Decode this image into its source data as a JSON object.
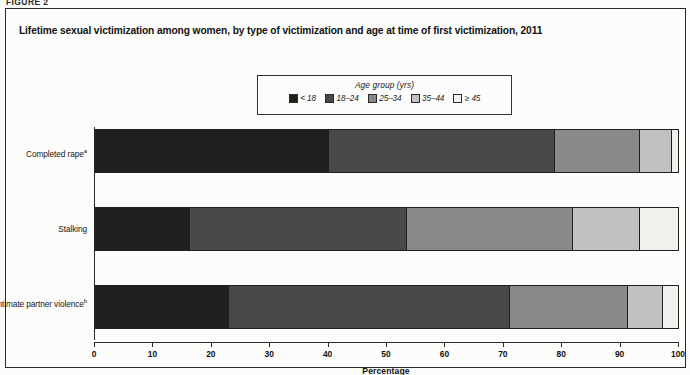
{
  "figure": {
    "kicker": "FIGURE 2",
    "title": "Lifetime sexual victimization among women, by type of victimization and age at time of first victimization, 2011"
  },
  "legend": {
    "title": "Age group (yrs)",
    "position": "top-center",
    "entries": [
      {
        "label": "< 18",
        "swatch_name": "swatch-under-18",
        "color": "#221f1f"
      },
      {
        "label": "18–24",
        "swatch_name": "swatch-18-24",
        "color": "#4a4848"
      },
      {
        "label": "25–34",
        "swatch_name": "swatch-25-34",
        "color": "#8a8a8a"
      },
      {
        "label": "35–44",
        "swatch_name": "swatch-35-44",
        "color": "#c2c2c2"
      },
      {
        "label": "≥ 45",
        "swatch_name": "swatch-45-plus",
        "color": "#f2f2ef"
      }
    ]
  },
  "axis": {
    "title": "Percentage",
    "ticks": [
      "0",
      "10",
      "20",
      "30",
      "40",
      "50",
      "60",
      "70",
      "80",
      "90",
      "100"
    ],
    "min": 0,
    "max": 100
  },
  "chart_data": {
    "type": "bar",
    "orientation": "horizontal",
    "stacked": true,
    "stack_total": 100,
    "title": "Lifetime sexual victimization among women, by type of victimization and age at time of first victimization, 2011",
    "xlabel": "Percentage",
    "ylabel": "",
    "xlim": [
      0,
      100
    ],
    "grid": false,
    "legend_position": "top-center",
    "categories": [
      "Completed rapeᵃ",
      "Stalking",
      "Intimate partner violenceᵇ"
    ],
    "category_labels_plain": [
      "Completed rape",
      "Stalking",
      "Intimate partner violence"
    ],
    "category_footnote_marks": [
      "a",
      "",
      "b"
    ],
    "series": [
      {
        "name": "< 18",
        "color": "#221f1f",
        "values": [
          40.1,
          16.1,
          22.9
        ]
      },
      {
        "name": "18–24",
        "color": "#4a4848",
        "values": [
          38.7,
          37.3,
          48.2
        ]
      },
      {
        "name": "25–34",
        "color": "#8a8a8a",
        "values": [
          14.7,
          28.6,
          20.3
        ]
      },
      {
        "name": "35–44",
        "color": "#c2c2c2",
        "values": [
          5.5,
          11.5,
          6.0
        ]
      },
      {
        "name": "≥ 45",
        "color": "#f2f2ef",
        "values": [
          1.0,
          6.5,
          2.6
        ]
      }
    ],
    "cumulative_boundaries": [
      [
        40.1,
        78.8,
        93.5,
        99.0,
        100.0
      ],
      [
        16.1,
        53.4,
        82.0,
        93.5,
        100.0
      ],
      [
        22.9,
        71.1,
        91.4,
        97.4,
        100.0
      ]
    ]
  }
}
